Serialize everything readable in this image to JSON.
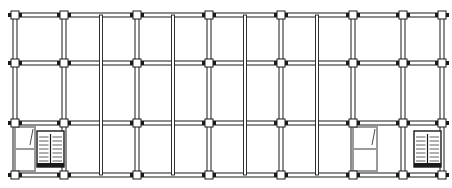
{
  "diagram": {
    "type": "structural-floor-plan",
    "grid_bounds": {
      "x0": 15,
      "y0": 15,
      "x1": 442,
      "y1": 175
    },
    "column_lines_x": [
      15,
      64,
      137,
      209,
      281,
      353,
      403,
      442
    ],
    "secondary_lines_x": [
      101,
      173,
      245,
      317
    ],
    "beam_lines_y": [
      15,
      63,
      123,
      175
    ],
    "stairs": [
      {
        "id": "stair-left",
        "x": 37,
        "y": 131,
        "w": 27,
        "h": 36
      },
      {
        "id": "stair-right",
        "x": 414,
        "y": 131,
        "w": 27,
        "h": 36
      }
    ],
    "rooms": [
      {
        "id": "lift-left",
        "x": 15,
        "y": 123,
        "w": 20,
        "h": 52
      },
      {
        "id": "lift-right",
        "x": 353,
        "y": 123,
        "w": 24,
        "h": 52
      }
    ],
    "colors": {
      "line": "#1a1a1a",
      "fill": "#d8d8d8",
      "wall_light": "#9a9a9a"
    }
  }
}
